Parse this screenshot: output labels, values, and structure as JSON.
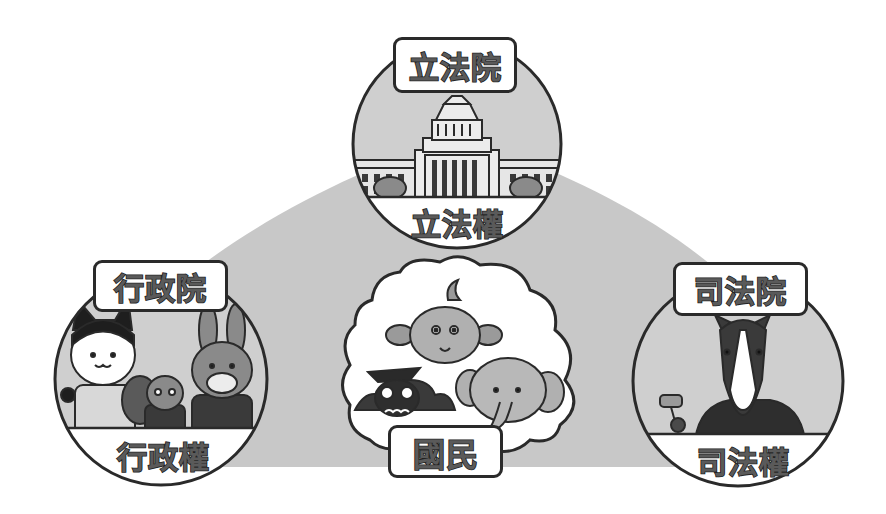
{
  "diagram": {
    "colors": {
      "background": "#ffffff",
      "triangle_fill": "#c8c8c8",
      "circle_fill": "#cfcfcf",
      "band_fill": "#ffffff",
      "outline": "#2a2a2a",
      "label_text": "#5a5a5a"
    },
    "nodes": {
      "legislative": {
        "institution_label": "立法院",
        "power_label": "立法權",
        "illustration": "legislative-building"
      },
      "executive": {
        "institution_label": "行政院",
        "power_label": "行政權",
        "illustration": "cat-squirrel-rabbit-officials"
      },
      "judicial": {
        "institution_label": "司法院",
        "power_label": "司法權",
        "illustration": "horse-judge-with-gavel"
      },
      "people": {
        "label": "國民",
        "illustration": "thought-cloud-with-dog-owl-elephant"
      }
    }
  }
}
